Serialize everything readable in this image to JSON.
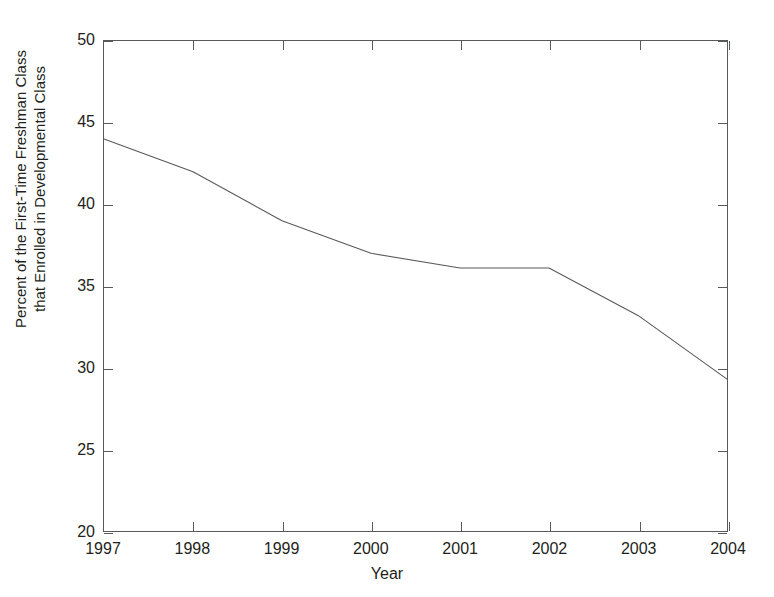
{
  "chart_data": {
    "type": "line",
    "title": "",
    "xlabel": "Year",
    "ylabel": "Percent of the First-Time Freshman Class that Enrolled in Developmental Class",
    "ylabel_lines": [
      "Percent of the First-Time Freshman Class",
      "that Enrolled in Developmental Class"
    ],
    "categories": [
      "1997",
      "1998",
      "1999",
      "2000",
      "2001",
      "2002",
      "2003",
      "2004"
    ],
    "x": [
      1997,
      1998,
      1999,
      2000,
      2001,
      2002,
      2003,
      2004
    ],
    "values": [
      44.0,
      42.0,
      39.0,
      37.0,
      36.1,
      36.1,
      33.2,
      29.3
    ],
    "series": [
      {
        "name": "Percent enrolled in developmental class",
        "values": [
          44.0,
          42.0,
          39.0,
          37.0,
          36.1,
          36.1,
          33.2,
          29.3
        ]
      }
    ],
    "xlim": [
      1997,
      2004
    ],
    "ylim": [
      20,
      50
    ],
    "yticks": [
      20,
      25,
      30,
      35,
      40,
      45,
      50
    ],
    "ytick_labels": [
      "20",
      "25",
      "30",
      "35",
      "40",
      "45",
      "50"
    ],
    "xticks": [
      1997,
      1998,
      1999,
      2000,
      2001,
      2002,
      2003,
      2004
    ],
    "xtick_labels": [
      "1997",
      "1998",
      "1999",
      "2000",
      "2001",
      "2002",
      "2003",
      "2004"
    ],
    "grid": false,
    "legend": false,
    "legend_position": "none",
    "line_color": "#58595b",
    "axis_color": "#58595b",
    "background_color": "#ffffff",
    "marker": "none"
  }
}
